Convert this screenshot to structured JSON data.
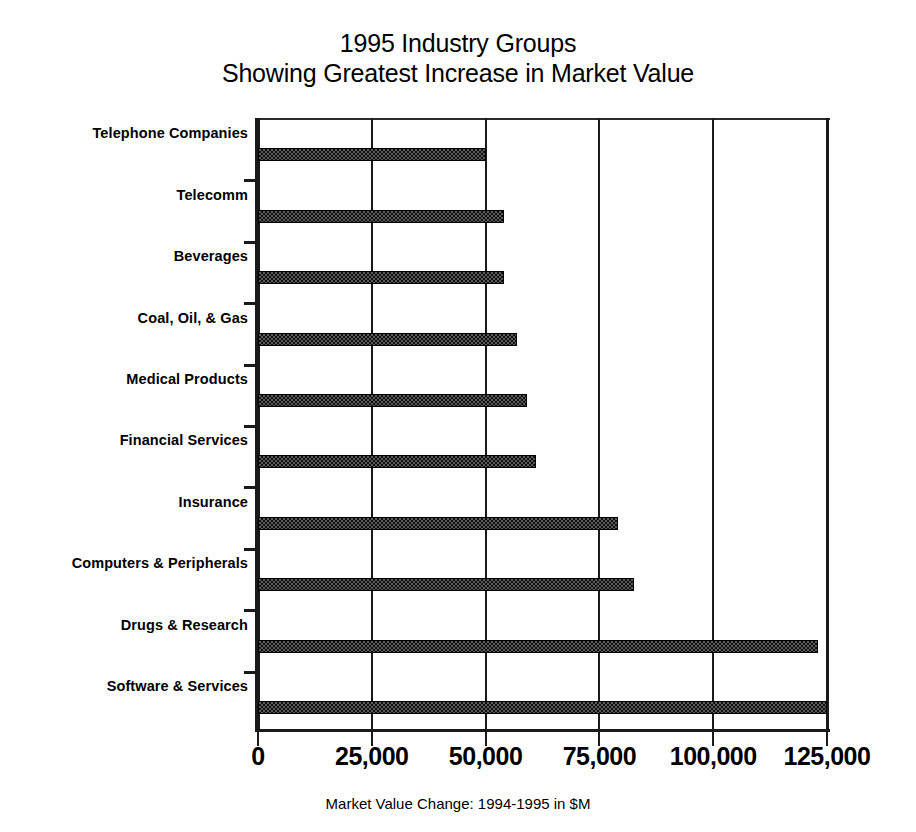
{
  "chart_data": {
    "type": "bar",
    "orientation": "horizontal",
    "title": "1995 Industry Groups Showing Greatest Increase in Market Value",
    "title_lines": [
      "1995 Industry Groups",
      "Showing Greatest Increase in Market Value"
    ],
    "xlabel": "Market Value Change: 1994-1995 in $M",
    "ylabel": "",
    "categories": [
      "Telephone Companies",
      "Telecomm",
      "Beverages",
      "Coal, Oil, & Gas",
      "Medical Products",
      "Financial Services",
      "Insurance",
      "Computers & Peripherals",
      "Drugs & Research",
      "Software & Services"
    ],
    "values": [
      50000,
      54000,
      54000,
      57000,
      59000,
      61000,
      79000,
      82500,
      123000,
      125000
    ],
    "xlim": [
      0,
      125000
    ],
    "xticks": [
      0,
      25000,
      50000,
      75000,
      100000,
      125000
    ],
    "xtick_labels": [
      "0",
      "25,000",
      "50,000",
      "75,000",
      "100,000",
      "125,000"
    ],
    "grid": "vertical",
    "legend": "none",
    "series_name": "Market Value Change",
    "bar_fill_color": "#5a5a5a",
    "bar_edge_color": "#000000",
    "axis_color": "#1a1a1a",
    "background_color": "#ffffff"
  }
}
